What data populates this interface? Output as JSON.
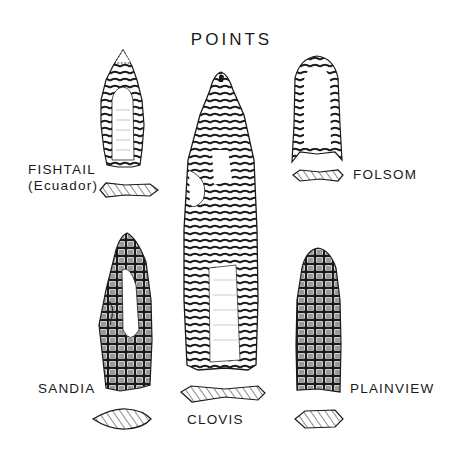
{
  "title": "POINTS",
  "points": [
    {
      "id": "fishtail",
      "label_line1": "FISHTAIL",
      "label_line2": "(Ecuador)"
    },
    {
      "id": "folsom",
      "label": "FOLSOM"
    },
    {
      "id": "clovis",
      "label": "CLOVIS"
    },
    {
      "id": "sandia",
      "label": "SANDIA"
    },
    {
      "id": "plainview",
      "label": "PLAINVIEW"
    }
  ],
  "colors": {
    "ink": "#1a1a1a",
    "background": "#ffffff"
  }
}
